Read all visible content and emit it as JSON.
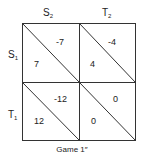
{
  "title": "Game 1″",
  "columns": [
    {
      "label": "S",
      "sub": "2"
    },
    {
      "label": "T",
      "sub": "2"
    }
  ],
  "rows": [
    {
      "label": "S",
      "sub": "1"
    },
    {
      "label": "T",
      "sub": "1"
    }
  ],
  "cells": [
    [
      {
        "row_payoff": "7",
        "col_payoff": "-7"
      },
      {
        "row_payoff": "4",
        "col_payoff": "-4"
      }
    ],
    [
      {
        "row_payoff": "12",
        "col_payoff": "-12"
      },
      {
        "row_payoff": "0",
        "col_payoff": "0"
      }
    ]
  ]
}
